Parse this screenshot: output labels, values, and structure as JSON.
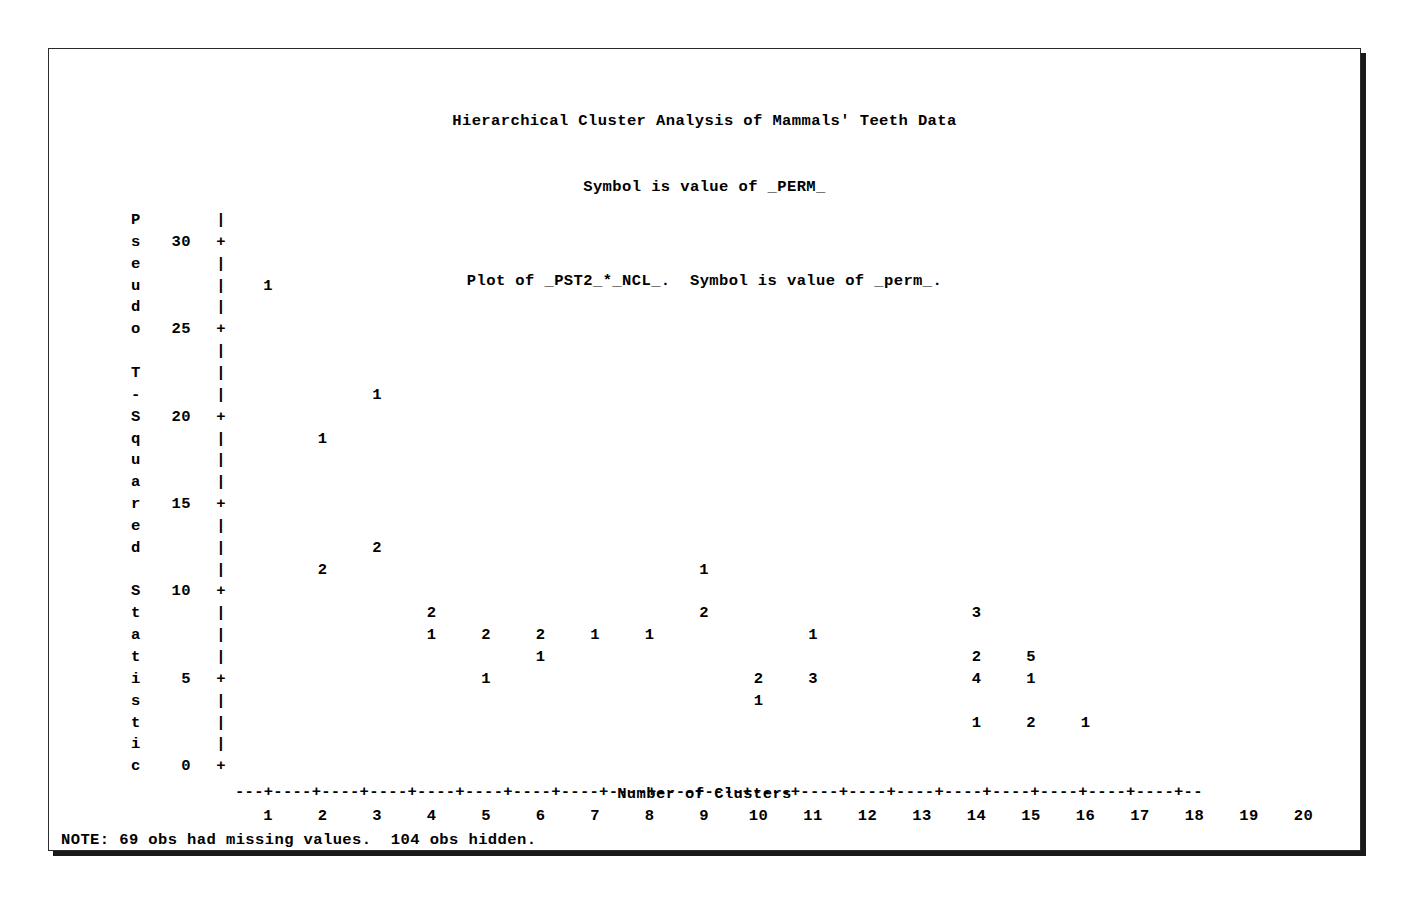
{
  "page": {
    "title_line1": "Hierarchical Cluster Analysis of Mammals' Teeth Data",
    "title_line2": "Symbol is value of _PERM_",
    "subtitle": "Plot of _PST2_*_NCL_.  Symbol is value of _perm_.",
    "note": "NOTE: 69 obs had missing values.  104 obs hidden.",
    "frame_color": "#2b2b2b",
    "text_color": "#000000",
    "background_color": "#ffffff"
  },
  "chart_data": {
    "type": "scatter",
    "title": "Hierarchical Cluster Analysis of Mammals' Teeth Data",
    "subtitle": "Plot of _PST2_*_NCL_.  Symbol is value of _perm_.",
    "xlabel": "Number of Clusters",
    "ylabel": "Pseudo T-Squared Statistic",
    "xlim": [
      1,
      20
    ],
    "ylim": [
      0,
      30
    ],
    "xticks": [
      1,
      2,
      3,
      4,
      5,
      6,
      7,
      8,
      9,
      10,
      11,
      12,
      13,
      14,
      15,
      16,
      17,
      18,
      19,
      20
    ],
    "yticks": [
      0,
      5,
      10,
      15,
      20,
      25,
      30
    ],
    "grid": false,
    "legend": "none",
    "symbol_meaning": "Symbol is value of _perm_ (overplot count / permutation id)",
    "row_value_step": 1.25,
    "points": [
      {
        "x": 1,
        "y": 27.5,
        "symbol": "1"
      },
      {
        "x": 3,
        "y": 21.25,
        "symbol": "1"
      },
      {
        "x": 2,
        "y": 18.75,
        "symbol": "1"
      },
      {
        "x": 3,
        "y": 12.5,
        "symbol": "2"
      },
      {
        "x": 2,
        "y": 11.25,
        "symbol": "2"
      },
      {
        "x": 9,
        "y": 11.25,
        "symbol": "1"
      },
      {
        "x": 4,
        "y": 8.75,
        "symbol": "2"
      },
      {
        "x": 9,
        "y": 8.75,
        "symbol": "2"
      },
      {
        "x": 14,
        "y": 8.75,
        "symbol": "3"
      },
      {
        "x": 4,
        "y": 7.5,
        "symbol": "1"
      },
      {
        "x": 5,
        "y": 7.5,
        "symbol": "2"
      },
      {
        "x": 6,
        "y": 7.5,
        "symbol": "2"
      },
      {
        "x": 7,
        "y": 7.5,
        "symbol": "1"
      },
      {
        "x": 8,
        "y": 7.5,
        "symbol": "1"
      },
      {
        "x": 11,
        "y": 7.5,
        "symbol": "1"
      },
      {
        "x": 6,
        "y": 6.25,
        "symbol": "1"
      },
      {
        "x": 14,
        "y": 6.25,
        "symbol": "2"
      },
      {
        "x": 15,
        "y": 6.25,
        "symbol": "5"
      },
      {
        "x": 5,
        "y": 5.0,
        "symbol": "1"
      },
      {
        "x": 10,
        "y": 5.0,
        "symbol": "2"
      },
      {
        "x": 11,
        "y": 5.0,
        "symbol": "3"
      },
      {
        "x": 14,
        "y": 5.0,
        "symbol": "4"
      },
      {
        "x": 15,
        "y": 5.0,
        "symbol": "1"
      },
      {
        "x": 10,
        "y": 3.75,
        "symbol": "1"
      },
      {
        "x": 14,
        "y": 2.5,
        "symbol": "1"
      },
      {
        "x": 15,
        "y": 2.5,
        "symbol": "2"
      },
      {
        "x": 16,
        "y": 2.5,
        "symbol": "1"
      }
    ]
  },
  "yaxis": {
    "label_chars": [
      "P",
      "s",
      "e",
      "u",
      "d",
      "o",
      "",
      "T",
      "-",
      "S",
      "q",
      "u",
      "a",
      "r",
      "e",
      "d",
      "",
      "S",
      "t",
      "a",
      "t",
      "i",
      "s",
      "t",
      "i",
      "c"
    ],
    "ticks": [
      {
        "value": "30",
        "row": 1
      },
      {
        "value": "25",
        "row": 5
      },
      {
        "value": "20",
        "row": 9
      },
      {
        "value": "15",
        "row": 13
      },
      {
        "value": "10",
        "row": 17
      },
      {
        "value": "5",
        "row": 21
      },
      {
        "value": "0",
        "row": 25
      }
    ],
    "tick_glyph": "+",
    "rule_glyph": "|"
  },
  "xaxis": {
    "rule": "---+----+----+----+----+----+----+----+----+----+----+----+----+----+----+----+----+----+----+----+--",
    "labels": [
      "1",
      "2",
      "3",
      "4",
      "5",
      "6",
      "7",
      "8",
      "9",
      "10",
      "11",
      "12",
      "13",
      "14",
      "15",
      "16",
      "17",
      "18",
      "19",
      "20"
    ],
    "title": "Number of Clusters"
  }
}
